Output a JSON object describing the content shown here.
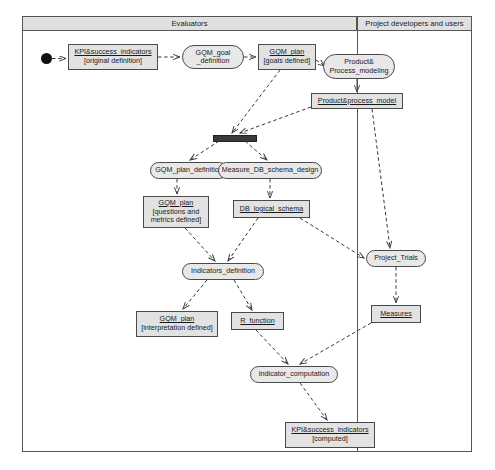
{
  "diagram": {
    "type": "uml-activity-diagram",
    "title": "",
    "frame": {
      "x": 22,
      "y": 16,
      "width": 450,
      "height": 436
    },
    "swimlanes": [
      {
        "id": "evaluators",
        "label": "Evaluators",
        "x": 22,
        "y": 16,
        "width": 335,
        "height": 436
      },
      {
        "id": "project-developers",
        "label": "Project developers and users",
        "x": 357,
        "y": 16,
        "width": 115,
        "height": 436
      }
    ],
    "lane_header_height": 15,
    "start_node": {
      "id": "start",
      "x": 41,
      "y": 53,
      "size": 11
    },
    "fork_bars": [
      {
        "id": "fork-1",
        "x": 213,
        "y": 135,
        "width": 42,
        "height": 5
      }
    ],
    "object_nodes": [
      {
        "id": "kpi-original",
        "name": "KPI&success_indicators",
        "state": "[original definition]",
        "x": 68,
        "y": 44,
        "width": 90,
        "height": 26
      },
      {
        "id": "gqm-plan-goals",
        "name": "GQM_plan",
        "state": "[goals defined]",
        "x": 258,
        "y": 44,
        "width": 58,
        "height": 26
      },
      {
        "id": "product-process-model",
        "name": "Product&process_model",
        "state": "",
        "x": 311,
        "y": 93,
        "width": 92,
        "height": 16
      },
      {
        "id": "gqm-plan-questions",
        "name": "GQM_plan",
        "state": "[questions and\nmetrics defined]",
        "x": 143,
        "y": 196,
        "width": 66,
        "height": 32
      },
      {
        "id": "db-logical-schema",
        "name": "DB_logical_schema",
        "state": "",
        "x": 233,
        "y": 200,
        "width": 77,
        "height": 18
      },
      {
        "id": "gqm-plan-interpretation",
        "name": "GQM_plan",
        "state": "[interpretation defined]",
        "x": 136,
        "y": 311,
        "width": 82,
        "height": 26
      },
      {
        "id": "r-function",
        "name": "R_function",
        "state": "",
        "x": 231,
        "y": 312,
        "width": 53,
        "height": 18
      },
      {
        "id": "measures",
        "name": "Measures",
        "state": "",
        "x": 371,
        "y": 305,
        "width": 50,
        "height": 18
      },
      {
        "id": "kpi-computed",
        "name": "KPI&success_indicators",
        "state": "[computed]",
        "x": 285,
        "y": 422,
        "width": 90,
        "height": 26
      }
    ],
    "action_nodes": [
      {
        "id": "gqm-goal-definition",
        "line1": "GQM_goal",
        "line2": "_definition",
        "x": 182,
        "y": 45,
        "width": 62,
        "height": 24
      },
      {
        "id": "product-process-modeling",
        "line1": "Product&",
        "line2": "Process_modeling",
        "x": 323,
        "y": 54,
        "width": 72,
        "height": 25
      },
      {
        "id": "gqm-plan-definition",
        "line1": "GQM_plan_definition",
        "line2": "",
        "x": 150,
        "y": 162,
        "width": 78,
        "height": 17
      },
      {
        "id": "measure-db-schema-design",
        "line1": "Measure_DB_schema_design",
        "line2": "",
        "x": 218,
        "y": 162,
        "width": 104,
        "height": 17
      },
      {
        "id": "indicators-definition",
        "line1": "Indicators_definition",
        "line2": "",
        "x": 182,
        "y": 263,
        "width": 82,
        "height": 17
      },
      {
        "id": "project-trials",
        "line1": "Project_Trials",
        "line2": "",
        "x": 366,
        "y": 250,
        "width": 60,
        "height": 17
      },
      {
        "id": "indicator-computation",
        "line1": "Indicator_computation",
        "line2": "",
        "x": 250,
        "y": 366,
        "width": 88,
        "height": 17
      }
    ],
    "edges": [
      {
        "id": "e-start-kpi",
        "from": "start",
        "to": "kpi-original",
        "style": "dashed",
        "points": "52,58.5 66,58.5"
      },
      {
        "id": "e-kpi-goal",
        "from": "kpi-original",
        "to": "gqm-goal-definition",
        "style": "dashed",
        "points": "158,57 180,57"
      },
      {
        "id": "e-goal-plan",
        "from": "gqm-goal-definition",
        "to": "gqm-plan-goals",
        "style": "dashed",
        "points": "244,57 256,57"
      },
      {
        "id": "e-plan-modeling",
        "from": "gqm-plan-goals",
        "to": "product-process-modeling",
        "style": "dashed",
        "points": "316,60 325,66"
      },
      {
        "id": "e-modeling-model",
        "from": "product-process-modeling",
        "to": "product-process-model",
        "style": "solid",
        "points": "357,79 357,92"
      },
      {
        "id": "e-plan-fork",
        "from": "gqm-plan-goals",
        "to": "fork-1",
        "style": "dashed",
        "points": "280,70 232,133"
      },
      {
        "id": "e-model-fork",
        "from": "product-process-model",
        "to": "fork-1",
        "style": "dashed",
        "points": "311,107 240,133"
      },
      {
        "id": "e-fork-gqmdef",
        "from": "fork-1",
        "to": "gqm-plan-definition",
        "style": "dashed",
        "points": "219,141 190,160"
      },
      {
        "id": "e-fork-measure",
        "from": "fork-1",
        "to": "measure-db-schema-design",
        "style": "dashed",
        "points": "245,141 267,160"
      },
      {
        "id": "e-gqmdef-gqmplan",
        "from": "gqm-plan-definition",
        "to": "gqm-plan-questions",
        "style": "dashed",
        "points": "177,179 177,194"
      },
      {
        "id": "e-measure-db",
        "from": "measure-db-schema-design",
        "to": "db-logical-schema",
        "style": "dashed",
        "points": "270,179 270,198"
      },
      {
        "id": "e-gqmplan-ind",
        "from": "gqm-plan-questions",
        "to": "indicators-definition",
        "style": "dashed",
        "points": "185,228 215,261"
      },
      {
        "id": "e-db-ind",
        "from": "db-logical-schema",
        "to": "indicators-definition",
        "style": "dashed",
        "points": "258,218 228,261"
      },
      {
        "id": "e-model-trials",
        "from": "product-process-model",
        "to": "project-trials",
        "style": "dashed",
        "points": "372,109 390,248"
      },
      {
        "id": "e-db-trials",
        "from": "db-logical-schema",
        "to": "project-trials",
        "style": "dashed",
        "points": "300,218 364,258"
      },
      {
        "id": "e-ind-gqmint",
        "from": "indicators-definition",
        "to": "gqm-plan-interpretation",
        "style": "dashed",
        "points": "207,280 183,309"
      },
      {
        "id": "e-ind-rfunc",
        "from": "indicators-definition",
        "to": "r-function",
        "style": "dashed",
        "points": "234,280 252,310"
      },
      {
        "id": "e-trials-measures",
        "from": "project-trials",
        "to": "measures",
        "style": "dashed",
        "points": "396,267 396,303"
      },
      {
        "id": "e-rfunc-indcomp",
        "from": "r-function",
        "to": "indicator-computation",
        "style": "dashed",
        "points": "256,330 288,364"
      },
      {
        "id": "e-measures-indcomp",
        "from": "measures",
        "to": "indicator-computation",
        "style": "dashed",
        "points": "371,323 300,364"
      },
      {
        "id": "e-indcomp-kpi",
        "from": "indicator-computation",
        "to": "kpi-computed",
        "style": "dashed",
        "points": "300,383 327,420"
      }
    ]
  }
}
